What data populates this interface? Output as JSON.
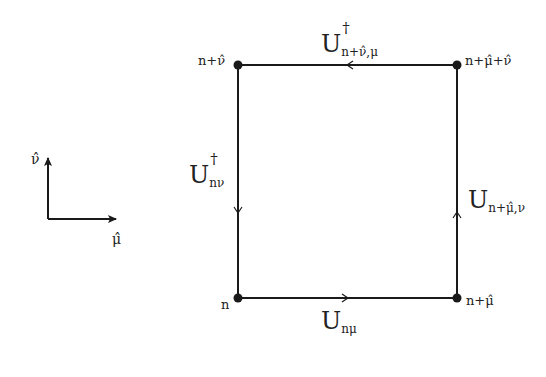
{
  "diagram": {
    "type": "lattice-plaquette",
    "nodes": {
      "bottom_left": "n",
      "bottom_right": "n+μ̂",
      "top_left": "n+ν̂",
      "top_right": "n+μ̂+ν̂"
    },
    "links": {
      "bottom": {
        "base": "U",
        "sub": "nμ",
        "sup": "",
        "direction": "right"
      },
      "right": {
        "base": "U",
        "sub": "n+μ̂,ν",
        "sup": "",
        "direction": "up"
      },
      "top": {
        "base": "U",
        "sub": "n+ν̂,μ",
        "sup": "†",
        "direction": "left"
      },
      "left": {
        "base": "U",
        "sub": "nν",
        "sup": "†",
        "direction": "down"
      }
    },
    "axes": {
      "vertical": "ν̂",
      "horizontal": "μ̂"
    },
    "colors": {
      "line": "#1a1a1a",
      "background": "#ffffff"
    }
  }
}
